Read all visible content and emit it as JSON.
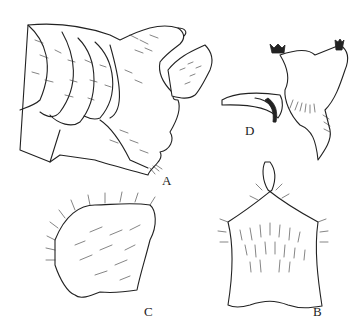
{
  "figure": {
    "panels": [
      {
        "id": "A",
        "label": "A",
        "content": "lateral view of abdominal terminal segments with overlapping setose plates"
      },
      {
        "id": "B",
        "label": "B",
        "content": "ventral plate, setose, with notched posterior margin"
      },
      {
        "id": "C",
        "label": "C",
        "content": "setose lobe / gonostylus"
      },
      {
        "id": "D",
        "label": "D",
        "content": "aedeagus / claspers with dark spines and curved process"
      }
    ]
  }
}
